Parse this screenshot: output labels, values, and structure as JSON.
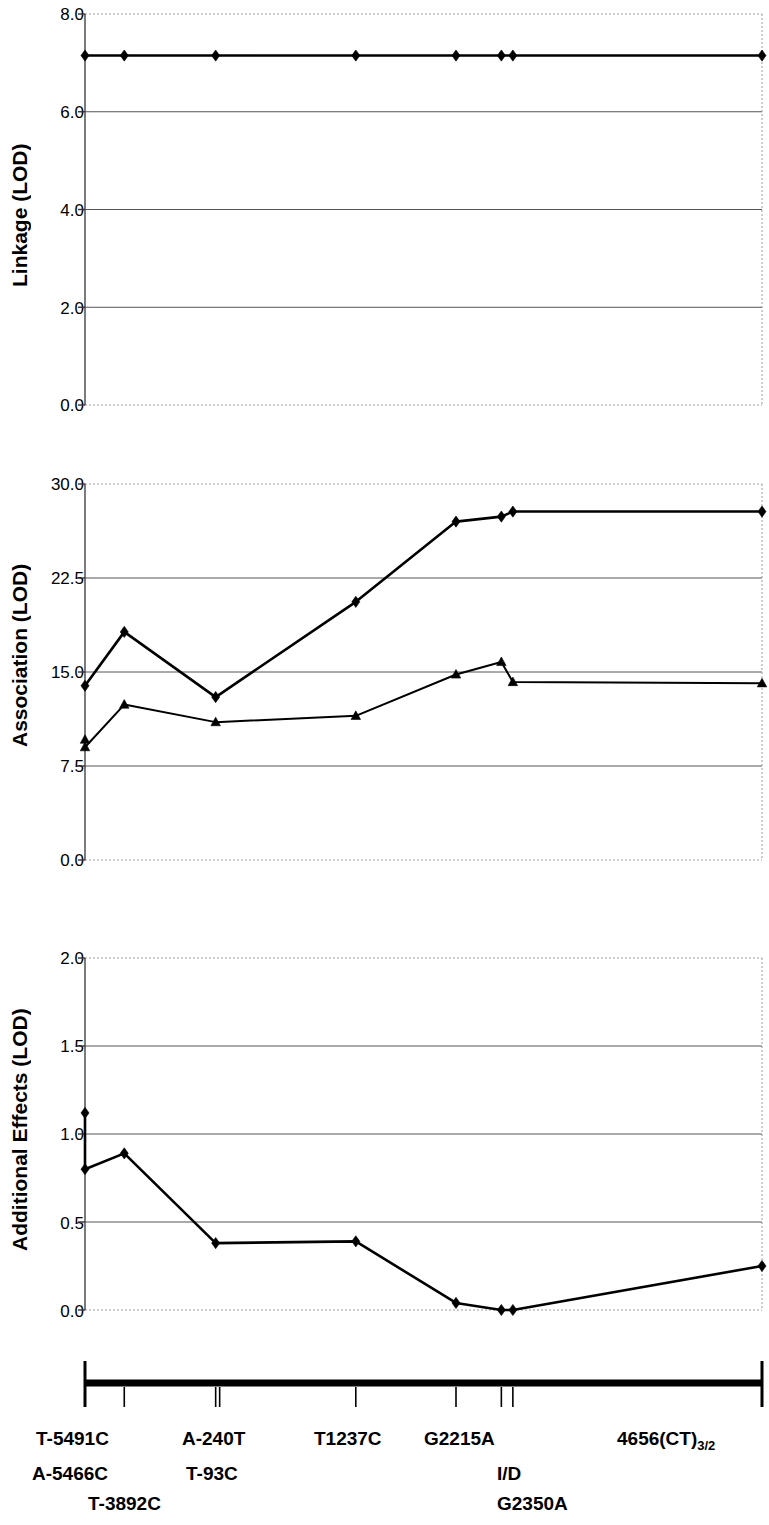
{
  "figure": {
    "panels": [
      {
        "id": "linkage",
        "ylabel": "Linkage (LOD)",
        "yticks": [
          "8.0",
          "6.0",
          "4.0",
          "2.0",
          "0.0"
        ]
      },
      {
        "id": "association",
        "ylabel": "Association (LOD)",
        "yticks": [
          "30.0",
          "22.5",
          "15.0",
          "7.5",
          "0.0"
        ]
      },
      {
        "id": "additional-effects",
        "ylabel": "Additional Effects (LOD)",
        "yticks": [
          "2.0",
          "1.5",
          "1.0",
          "0.5",
          "0.0"
        ]
      }
    ],
    "gene_map": {
      "marker_labels_row1": [
        {
          "text": "T-5491C",
          "x": 36
        },
        {
          "text": "A-240T",
          "x": 182
        },
        {
          "text": "T1237C",
          "x": 314
        },
        {
          "text": "G2215A",
          "x": 424
        },
        {
          "text": "4656(CT)",
          "x": 617,
          "subscript": "3/2"
        }
      ],
      "marker_labels_row2": [
        {
          "text": "A-5466C",
          "x": 32
        },
        {
          "text": "T-93C",
          "x": 186
        },
        {
          "text": "I/D",
          "x": 497
        }
      ],
      "marker_labels_row3": [
        {
          "text": "T-3892C",
          "x": 88
        },
        {
          "text": "G2350A",
          "x": 497
        }
      ]
    }
  },
  "chart_data": [
    {
      "type": "line",
      "title": "",
      "panel": "Linkage",
      "xlabel": "",
      "ylabel": "Linkage (LOD)",
      "ylim": [
        0.0,
        8.0
      ],
      "yticks": [
        0.0,
        2.0,
        4.0,
        6.0,
        8.0
      ],
      "xlim": [
        0,
        100
      ],
      "grid": true,
      "legend": "none",
      "series": [
        {
          "name": "Linkage LOD",
          "marker": "diamond",
          "x": [
            0.0,
            5.8,
            19.3,
            40.0,
            54.8,
            61.5,
            63.2,
            100.0
          ],
          "values": [
            7.15,
            7.15,
            7.15,
            7.15,
            7.15,
            7.15,
            7.15,
            7.15
          ]
        }
      ]
    },
    {
      "type": "line",
      "title": "",
      "panel": "Association",
      "xlabel": "",
      "ylabel": "Association (LOD)",
      "ylim": [
        0.0,
        30.0
      ],
      "yticks": [
        0.0,
        7.5,
        15.0,
        22.5,
        30.0
      ],
      "xlim": [
        0,
        100
      ],
      "grid": true,
      "legend": "none",
      "series": [
        {
          "name": "Association LOD (diamond)",
          "marker": "diamond",
          "x": [
            0.0,
            5.8,
            19.3,
            40.0,
            54.8,
            61.5,
            63.2,
            100.0
          ],
          "values": [
            13.9,
            18.2,
            13.0,
            20.6,
            27.0,
            27.4,
            27.8,
            27.8
          ]
        },
        {
          "name": "Association LOD (triangle)",
          "marker": "triangle",
          "x": [
            0.0,
            0.0,
            5.8,
            19.3,
            40.0,
            54.8,
            61.5,
            63.2,
            100.0
          ],
          "values": [
            9.6,
            9.0,
            12.4,
            11.0,
            11.5,
            14.8,
            15.8,
            14.2,
            14.1
          ]
        }
      ]
    },
    {
      "type": "line",
      "title": "",
      "panel": "Additional Effects",
      "xlabel": "",
      "ylabel": "Additional Effects (LOD)",
      "ylim": [
        0.0,
        2.0
      ],
      "yticks": [
        0.0,
        0.5,
        1.0,
        1.5,
        2.0
      ],
      "xlim": [
        0,
        100
      ],
      "grid": true,
      "legend": "none",
      "series": [
        {
          "name": "Additional Effects LOD",
          "marker": "diamond",
          "x": [
            0.0,
            0.0,
            5.8,
            19.3,
            40.0,
            54.8,
            61.5,
            63.2,
            100.0
          ],
          "values": [
            1.12,
            0.8,
            0.89,
            0.38,
            0.39,
            0.04,
            0.0,
            0.0,
            0.25
          ]
        }
      ]
    }
  ]
}
